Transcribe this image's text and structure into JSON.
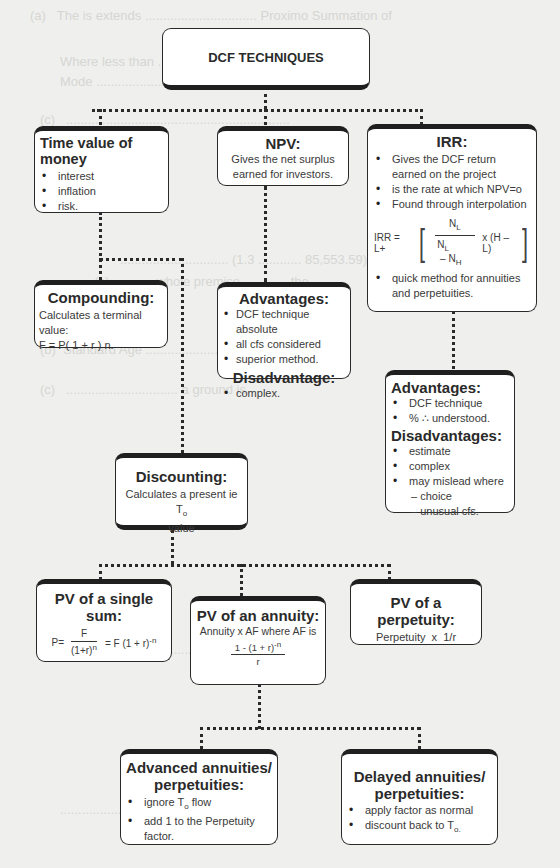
{
  "root": {
    "title": "DCF TECHNIQUES"
  },
  "time_value": {
    "title": "Time value of money",
    "items": [
      "interest",
      "inflation",
      "risk."
    ]
  },
  "npv": {
    "title": "NPV:",
    "line1": "Gives the net surplus",
    "line2": "earned for investors."
  },
  "irr": {
    "title": "IRR:",
    "items": [
      "Gives the DCF return earned on the project",
      "is the rate at which NPV=o",
      "Found through interpolation"
    ],
    "formula": {
      "lhs": "IRR = L+",
      "num": "N",
      "num_sub": "L",
      "den_a": "N",
      "den_a_sub": "L",
      "den_op": " – ",
      "den_b": "N",
      "den_b_sub": "H",
      "tail": "x (H – L)"
    },
    "items2": [
      "quick method for annuities and perpetuities."
    ]
  },
  "compounding": {
    "title": "Compounding:",
    "line1": "Calculates a terminal value:",
    "line2": "F = P( 1 + r ) n."
  },
  "npv_adv": {
    "adv_title": "Advantages:",
    "adv_items": [
      "DCF technique absolute",
      "all cfs considered",
      "superior method."
    ],
    "dis_title": "Disadvantage:",
    "dis_items": [
      "complex."
    ]
  },
  "irr_adv": {
    "adv_title": "Advantages:",
    "adv_items": [
      "DCF technique",
      "% ∴ understood."
    ],
    "dis_title": "Disadvantages:",
    "dis_items": [
      "estimate",
      "complex",
      "may mislead where"
    ],
    "dis_sub": [
      "– choice",
      "– unusual cfs."
    ]
  },
  "discounting": {
    "title": "Discounting:",
    "line1": "Calculates a present ie T",
    "line1_sub": "o",
    "line2": "value"
  },
  "pv_single": {
    "title": "PV of a single sum:",
    "lhs": "P=",
    "num": "F",
    "den": "(1+r)",
    "den_sup": "n",
    "rhs": "= F (1 + r)",
    "rhs_sup": "-n"
  },
  "pv_annuity": {
    "title": "PV of an annuity:",
    "line1": "Annuity x AF  where AF is",
    "num": "1 - (1 + r)",
    "num_sup": "-n",
    "den": "r"
  },
  "pv_perpetuity": {
    "title": "PV of a perpetuity:",
    "line1": "Perpetuity  x  1/r"
  },
  "advanced": {
    "title1": "Advanced annuities/",
    "title2": "perpetuities:",
    "item1_pre": "ignore T",
    "item1_sub": "o",
    "item1_post": " flow",
    "item2": "add 1 to the Perpetuity factor."
  },
  "delayed": {
    "title1": "Delayed annuities/",
    "title2": "perpetuities:",
    "item1": "apply factor as normal",
    "item2_pre": "discount back to T",
    "item2_sub": "o."
  }
}
